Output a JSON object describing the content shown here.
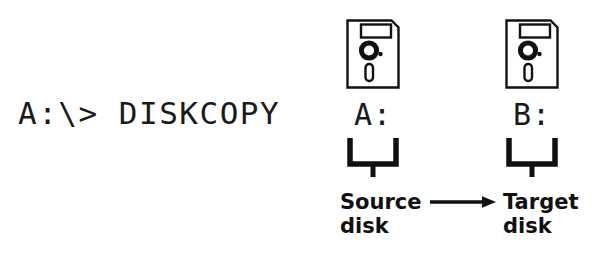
{
  "figure": {
    "type": "dos-diskcopy-diagram",
    "background_color": "#ffffff",
    "ink_color": "#111111"
  },
  "command_prompt": {
    "text": "A:\\> DISKCOPY"
  },
  "drives": [
    {
      "id": "source",
      "icon": "floppy-disk-icon",
      "label": "A:",
      "brace": "down-brace",
      "caption_line1": "Source",
      "caption_line2": "disk"
    },
    {
      "id": "target",
      "icon": "floppy-disk-icon",
      "label": "B:",
      "brace": "down-brace",
      "caption_line1": "Target",
      "caption_line2": "disk"
    }
  ],
  "flow": {
    "arrow": "right-arrow-icon",
    "direction": "source-to-target"
  }
}
